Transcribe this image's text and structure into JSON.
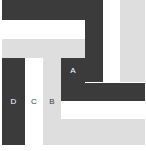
{
  "diagram": {
    "width": 146,
    "height": 151,
    "background": "#ffffff",
    "palette": {
      "dark": "#3b3b3b",
      "light_gray": "#dedede",
      "white": "#ffffff",
      "label_on_dark": "#ffffff",
      "label_on_light": "#3b3b3b"
    },
    "blocks": [
      {
        "name": "top-dark-band",
        "fill": "dark",
        "x": 2,
        "y": 0,
        "w": 83,
        "h": 20
      },
      {
        "name": "upper-white-band",
        "fill": "white",
        "x": 2,
        "y": 20,
        "w": 83,
        "h": 19
      },
      {
        "name": "upper-gray-band",
        "fill": "light_gray",
        "x": 2,
        "y": 39,
        "w": 83,
        "h": 19
      },
      {
        "name": "right-dark-column",
        "fill": "dark",
        "x": 85,
        "y": 0,
        "w": 18,
        "h": 82
      },
      {
        "name": "right-white-column",
        "fill": "white",
        "x": 103,
        "y": 0,
        "w": 17,
        "h": 82
      },
      {
        "name": "right-gray-column",
        "fill": "light_gray",
        "x": 120,
        "y": 0,
        "w": 25,
        "h": 82
      },
      {
        "name": "region-d-column",
        "fill": "dark",
        "x": 2,
        "y": 58,
        "w": 23,
        "h": 87
      },
      {
        "name": "region-c-column",
        "fill": "white",
        "x": 25,
        "y": 58,
        "w": 18,
        "h": 87
      },
      {
        "name": "region-b-column",
        "fill": "light_gray",
        "x": 43,
        "y": 58,
        "w": 18,
        "h": 87
      },
      {
        "name": "region-a-block",
        "fill": "dark",
        "x": 61,
        "y": 58,
        "w": 24,
        "h": 25
      },
      {
        "name": "mid-gray-filler",
        "fill": "light_gray",
        "x": 61,
        "y": 83,
        "w": 24,
        "h": 62
      },
      {
        "name": "lower-dark-band",
        "fill": "dark",
        "x": 61,
        "y": 83,
        "w": 84,
        "h": 18
      },
      {
        "name": "lower-white-band",
        "fill": "white",
        "x": 61,
        "y": 101,
        "w": 84,
        "h": 18
      },
      {
        "name": "lower-gray-band",
        "fill": "light_gray",
        "x": 61,
        "y": 119,
        "w": 84,
        "h": 26
      }
    ],
    "labels": [
      {
        "name": "region-label-a",
        "text": "A",
        "x": 61,
        "y": 58,
        "w": 24,
        "h": 25,
        "on": "dark"
      },
      {
        "name": "region-label-b",
        "text": "B",
        "x": 43,
        "y": 95,
        "w": 18,
        "h": 14,
        "on": "light"
      },
      {
        "name": "region-label-c",
        "text": "C",
        "x": 25,
        "y": 95,
        "w": 18,
        "h": 14,
        "on": "light"
      },
      {
        "name": "region-label-d",
        "text": "D",
        "x": 2,
        "y": 95,
        "w": 23,
        "h": 14,
        "on": "dark"
      }
    ]
  }
}
